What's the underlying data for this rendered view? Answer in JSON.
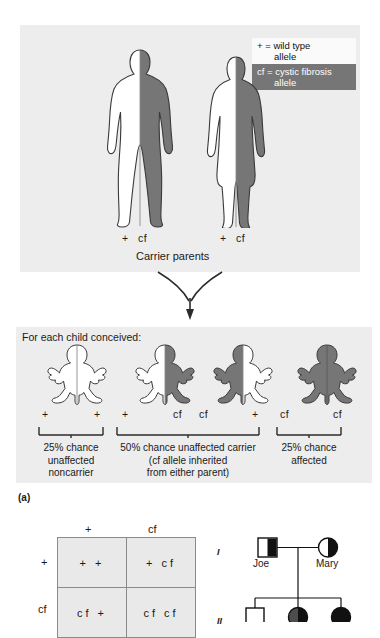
{
  "figure": {
    "label": "(a)",
    "legend": {
      "wild_symbol": "+",
      "wild_text": "= wild type",
      "wild_text2": "allele",
      "cf_symbol": "cf",
      "cf_text": "= cystic fibrosis",
      "cf_text2": "allele",
      "wild_bg": "#fafafa",
      "cf_bg": "#767676"
    },
    "colors": {
      "panel_bg": "#ededed",
      "cf_gray": "#767676",
      "wild_white": "#ffffff",
      "outline": "#333333"
    }
  },
  "parents": {
    "caption": "Carrier parents",
    "father": {
      "allele_left": "+",
      "allele_right": "cf"
    },
    "mother": {
      "allele_left": "+",
      "allele_right": "cf"
    }
  },
  "children": {
    "heading": "For each child conceived:",
    "items": [
      {
        "allele_left": "+",
        "allele_right": "+",
        "left_fill": "white",
        "right_fill": "white"
      },
      {
        "allele_left": "+",
        "allele_right": "cf",
        "left_fill": "white",
        "right_fill": "gray"
      },
      {
        "allele_left": "cf",
        "allele_right": "+",
        "left_fill": "gray",
        "right_fill": "white"
      },
      {
        "allele_left": "cf",
        "allele_right": "cf",
        "left_fill": "gray",
        "right_fill": "gray"
      }
    ],
    "outcomes": [
      {
        "line1": "25% chance",
        "line2": "unaffected",
        "line3": "noncarrier"
      },
      {
        "line1": "50% chance unaffected carrier",
        "line2": "(cf allele inherited",
        "line3": "from either parent)"
      },
      {
        "line1": "25% chance",
        "line2": "affected",
        "line3": ""
      }
    ]
  },
  "punnett": {
    "col_headers": [
      "+",
      "cf"
    ],
    "row_headers": [
      "+",
      "cf"
    ],
    "cells": [
      [
        "+  +",
        "+  cf"
      ],
      [
        "cf  +",
        "cf  cf"
      ]
    ]
  },
  "pedigree": {
    "generations": [
      "I",
      "II"
    ],
    "individuals": [
      {
        "name": "Joe",
        "sex": "male",
        "status": "carrier"
      },
      {
        "name": "Mary",
        "sex": "female",
        "status": "carrier"
      },
      {
        "name": "",
        "sex": "male",
        "status": "unaffected"
      },
      {
        "name": "",
        "sex": "female",
        "status": "affected"
      },
      {
        "name": "",
        "sex": "female",
        "status": "affected"
      }
    ]
  }
}
